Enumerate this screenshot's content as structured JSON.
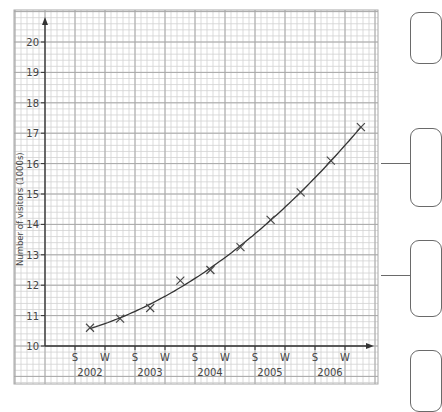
{
  "chart_data": {
    "type": "scatter",
    "title": "",
    "xlabel": "",
    "ylabel": "Number of visitors (1000s)",
    "ylim": [
      10,
      20
    ],
    "y_ticks": [
      10,
      11,
      12,
      13,
      14,
      15,
      16,
      17,
      18,
      19,
      20
    ],
    "x_ticks": [
      "S",
      "W",
      "S",
      "W",
      "S",
      "W",
      "S",
      "W",
      "S",
      "W"
    ],
    "year_labels": [
      "2002",
      "2003",
      "2004",
      "2005",
      "2006"
    ],
    "grid": true,
    "curve_of_best_fit": true,
    "series": [
      {
        "name": "Visitors",
        "marker": "x",
        "x": [
          "2002 S-W",
          "2002/03 W-S",
          "2003 S-W",
          "2003/04 W-S",
          "2004 S-W",
          "2004/05 W-S",
          "2005 S-W",
          "2005/06 W-S",
          "2006 S-W",
          "2006 W+"
        ],
        "values": [
          10.6,
          10.9,
          11.25,
          12.15,
          12.5,
          13.25,
          14.15,
          15.05,
          16.1,
          17.2
        ]
      }
    ]
  },
  "colors": {
    "grid_minor": "#d2d2d2",
    "grid_major": "#a8a8a8",
    "axis": "#333333",
    "curve": "#333333",
    "marker": "#444444",
    "text": "#444444"
  },
  "side_boxes": [
    {
      "top": 12,
      "height": 50
    },
    {
      "top": 128,
      "height": 77,
      "connector_y": 163
    },
    {
      "top": 240,
      "height": 75,
      "connector_y": 275
    },
    {
      "top": 350,
      "height": 60
    }
  ]
}
